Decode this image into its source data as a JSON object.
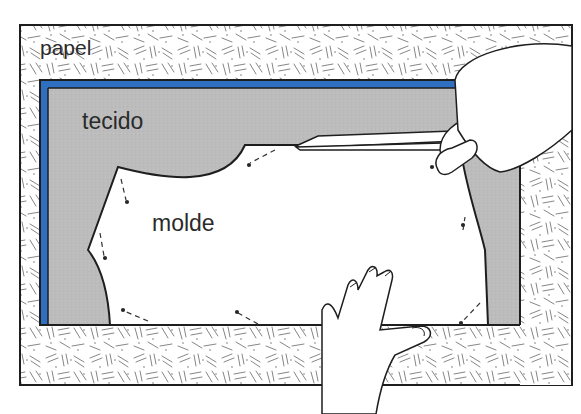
{
  "diagram": {
    "title": "",
    "labels": {
      "paper": "papel",
      "fabric": "tecido",
      "pattern": "molde"
    },
    "colors": {
      "paper_bg": "#ffffff",
      "paper_texture": "#6e6e6e",
      "fabric": "#bdbdbd",
      "selvage_blue": "#2f6fc0",
      "outline": "#1e1e1e",
      "pattern": "#ffffff"
    },
    "elements": [
      {
        "id": "paper-sheet",
        "description": "textured paper underlay"
      },
      {
        "id": "fabric",
        "description": "gray fabric with blue selvage edge on top and left"
      },
      {
        "id": "pattern-piece",
        "description": "white pattern piece pinned on fabric"
      },
      {
        "id": "pins",
        "description": "dashed pin marks along pattern edge"
      },
      {
        "id": "scissors",
        "description": "scissors cutting along pattern edge"
      },
      {
        "id": "cutting-hand",
        "description": "right hand holding scissors"
      },
      {
        "id": "holding-hand",
        "description": "left hand holding fabric flat"
      }
    ]
  }
}
